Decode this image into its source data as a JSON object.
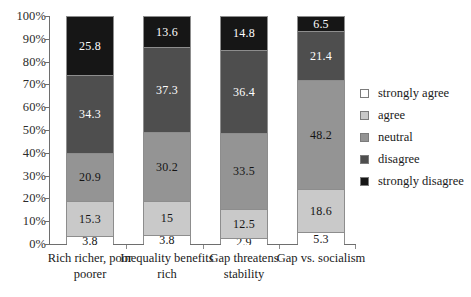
{
  "chart_data": {
    "type": "bar",
    "subtype": "stacked-bar-100-percent",
    "title": "",
    "xlabel": "",
    "ylabel": "",
    "ylim": [
      0,
      100
    ],
    "grid": false,
    "legend_position": "right",
    "categories": [
      "Rich richer, poor poorer",
      "Inequality benefits rich",
      "Gap threatens stability",
      "Gap vs. socialism"
    ],
    "series": [
      {
        "name": "strongly disagree",
        "color": "#161616",
        "values": [
          3.8,
          3.8,
          2.9,
          5.3
        ]
      },
      {
        "name": "disagree",
        "color": "#4e4e4e",
        "values": [
          15.3,
          15,
          12.5,
          18.6
        ]
      },
      {
        "name": "neutral",
        "color": "#949494",
        "values": [
          20.9,
          30.2,
          33.5,
          48.2
        ]
      },
      {
        "name": "agree",
        "color": "#c9c9c9",
        "values": [
          34.3,
          37.3,
          36.4,
          21.4
        ]
      },
      {
        "name": "strongly agree",
        "color": "#ffffff",
        "values": [
          25.8,
          13.6,
          14.8,
          6.5
        ]
      }
    ],
    "value_labels": [
      [
        "3.8",
        "15.3",
        "20.9",
        "34.3",
        "25.8"
      ],
      [
        "3.8",
        "15",
        "30.2",
        "37.3",
        "13.6"
      ],
      [
        "2.9",
        "12.5",
        "33.5",
        "36.4",
        "14.8"
      ],
      [
        "5.3",
        "18.6",
        "48.2",
        "21.4",
        "6.5"
      ]
    ],
    "yticks": [
      "0%",
      "10%",
      "20%",
      "30%",
      "40%",
      "50%",
      "60%",
      "70%",
      "80%",
      "90%",
      "100%"
    ]
  },
  "legend": {
    "items": [
      {
        "label": "strongly agree",
        "color": "#ffffff"
      },
      {
        "label": "agree",
        "color": "#c9c9c9"
      },
      {
        "label": "neutral",
        "color": "#949494"
      },
      {
        "label": "disagree",
        "color": "#4e4e4e"
      },
      {
        "label": "strongly disagree",
        "color": "#161616"
      }
    ]
  }
}
